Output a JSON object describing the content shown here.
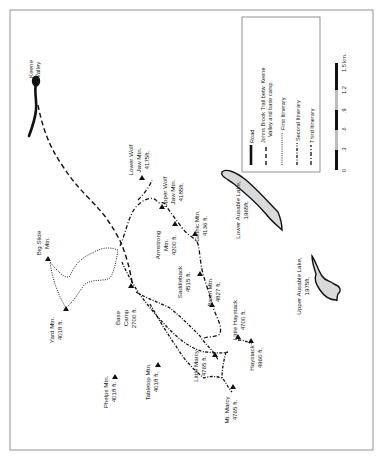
{
  "map": {
    "frame_color": "#777777",
    "lake_fill": "#d9d9d9",
    "ink": "#111111"
  },
  "places": {
    "keene_valley": [
      "Keene",
      "Valley"
    ],
    "base_camp": [
      "Base",
      "Camp",
      "2700 ft."
    ],
    "big_slide": [
      "Big Slide",
      "Mtn."
    ],
    "yard": [
      "Yard Mtn.",
      "4018 ft."
    ],
    "phelps": [
      "Phelps Mtn.",
      "4018 ft."
    ],
    "tabletop": [
      "Tabletop Mtn.",
      "4018 ft."
    ],
    "lower_wolf_jaw": [
      "Lower Wolf",
      "Jaw Mtn.",
      "4175ft."
    ],
    "upper_wolf_jaw": [
      "Upper Wolf",
      "Jaw Mtn.",
      "4185ft."
    ],
    "armstrong": [
      "Armstrong",
      "Mtn.",
      "4200 ft."
    ],
    "gothics": [
      "Gothic Mtn.",
      "4136 ft."
    ],
    "saddleback": [
      "Saddleback",
      "4515 ft."
    ],
    "basin": [
      "Basin Mtn.",
      "4827 ft."
    ],
    "little_haystack": [
      "Little Haystack",
      "4700 ft."
    ],
    "haystack": [
      "Haystack",
      "4960 ft."
    ],
    "little_marcy": [
      "Little Marcy",
      "4765 ft."
    ],
    "mt_marcy": [
      "Mt. Marcy",
      "4765 ft."
    ],
    "lower_ausable": [
      "Lower Ausable Lake,",
      "1965ft."
    ],
    "upper_ausable": [
      "Upper Ausable Lake,",
      "1975ft."
    ]
  },
  "legend": {
    "items": [
      {
        "symbol": "road",
        "label": [
          "Road"
        ]
      },
      {
        "symbol": "long-dash",
        "label": [
          "Johns Brook Trail betw. Keene",
          "Valley and base camp"
        ]
      },
      {
        "symbol": "dotted",
        "label": [
          "First Itinerary"
        ]
      },
      {
        "symbol": "dash-dot-fine",
        "label": [
          "Second Itinerary"
        ]
      },
      {
        "symbol": "dash-dot",
        "label": [
          "Third Itinerary"
        ]
      }
    ]
  },
  "scale": {
    "ticks": [
      "0",
      ".3",
      ".6",
      ".9",
      "1.2",
      "1.5 km."
    ]
  }
}
